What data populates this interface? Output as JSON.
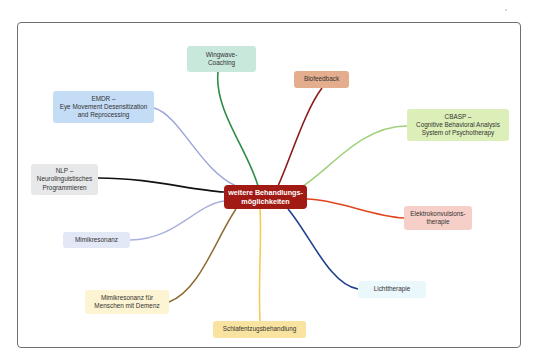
{
  "diagram": {
    "type": "mindmap",
    "center": {
      "lines": [
        "weitere Behandlungs-",
        "möglichkeiten"
      ],
      "color": "#a11a14"
    },
    "branches": [
      {
        "id": "wingwave",
        "lines": [
          "Wingwave-",
          "Coaching"
        ],
        "fill": "#c8e8dc",
        "link_color": "#2e8b4a"
      },
      {
        "id": "biofeedback",
        "lines": [
          "Biofeedback"
        ],
        "fill": "#e4ad8e",
        "link_color": "#8b1a1a"
      },
      {
        "id": "cbasp",
        "lines": [
          "CBASP –",
          "Cognitive Behavioral Analysis",
          "System of Psychotherapy"
        ],
        "fill": "#dcefb8",
        "link_color": "#9ed07a"
      },
      {
        "id": "emdr",
        "lines": [
          "EMDR –",
          "Eye Movement Desensitization",
          "and Reprocessing"
        ],
        "fill": "#c4dcf6",
        "link_color": "#9aa4d8"
      },
      {
        "id": "nlp",
        "lines": [
          "NLP –",
          "Neurolinguistisches",
          "Programmieren"
        ],
        "fill": "#e6e8ea",
        "link_color": "#111111"
      },
      {
        "id": "mimikresonanz",
        "lines": [
          "Mimikresonanz"
        ],
        "fill": "#e2e8f6",
        "link_color": "#a8b0dc"
      },
      {
        "id": "mimikresonanz-demenz",
        "lines": [
          "Mimikresonanz für",
          "Menschen mit Demenz"
        ],
        "fill": "#fdf4d4",
        "link_color": "#8e6c32"
      },
      {
        "id": "schlafentzug",
        "lines": [
          "Schlafentzugsbehandlung"
        ],
        "fill": "#f9e3a0",
        "link_color": "#f2c94c"
      },
      {
        "id": "elektrokonvulsion",
        "lines": [
          "Elektrokonvulsions-",
          "therapie"
        ],
        "fill": "#f6d0c8",
        "link_color": "#e0441c"
      },
      {
        "id": "lichttherapie",
        "lines": [
          "Lichttherapie"
        ],
        "fill": "#eaf7fb",
        "link_color": "#1e3f8e"
      }
    ]
  }
}
